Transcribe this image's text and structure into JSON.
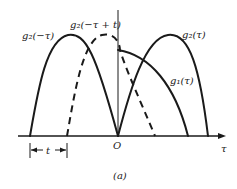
{
  "figure": {
    "caption": "(a)",
    "axis": {
      "horizontal_label": "τ",
      "origin_label": "O"
    },
    "curves": [
      {
        "id": "g2_neg_tau",
        "label": "g₂(−τ)",
        "style": "solid"
      },
      {
        "id": "g2_neg_tau_plus_t",
        "label": "g₂(−τ + t)",
        "style": "dashed"
      },
      {
        "id": "g2_tau",
        "label": "g₂(τ)",
        "style": "solid"
      },
      {
        "id": "g1_tau",
        "label": "g₁(τ)",
        "style": "solid"
      }
    ],
    "shift": {
      "label": "t"
    },
    "colors": {
      "ink": "#1a1a1a",
      "background": "#ffffff"
    }
  }
}
